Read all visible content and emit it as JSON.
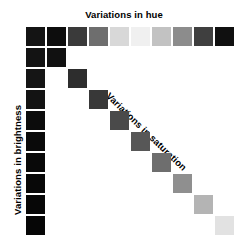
{
  "figure": {
    "background_color": "#ffffff",
    "text_color": "#000000"
  },
  "titles": {
    "hue": "Variations in hue",
    "brightness": "Variations in brightness",
    "saturation": "Variations in saturation"
  },
  "chart_data": {
    "type": "heatmap",
    "title": "Variations in hue",
    "xlabel": "Variations in hue",
    "ylabel": "Variations in brightness",
    "annotations": [
      {
        "text": "Variations in hue",
        "position": "top",
        "rotation": 0
      },
      {
        "text": "Variations in brightness",
        "position": "left",
        "rotation": -90
      },
      {
        "text": "Variations in saturation",
        "position": "diagonal",
        "rotation": 44
      }
    ],
    "grid": {
      "rows": 10,
      "cols": 10,
      "cell_px": 19,
      "pitch_px": 21
    },
    "legend_position": "none",
    "series": [
      {
        "name": "Variations in hue",
        "axis": "top-row",
        "row": 0,
        "cells": [
          {
            "col": 0,
            "color": "#141414"
          },
          {
            "col": 1,
            "color": "#0d0d0d"
          },
          {
            "col": 2,
            "color": "#3a3a3a"
          },
          {
            "col": 3,
            "color": "#6e6e6e"
          },
          {
            "col": 4,
            "color": "#d8d8d8"
          },
          {
            "col": 5,
            "color": "#f0f0f0"
          },
          {
            "col": 6,
            "color": "#c2c2c2"
          },
          {
            "col": 7,
            "color": "#8c8c8c"
          },
          {
            "col": 8,
            "color": "#3f3f3f"
          },
          {
            "col": 9,
            "color": "#101010"
          }
        ]
      },
      {
        "name": "Variations in brightness",
        "axis": "left-column",
        "col": 0,
        "cells": [
          {
            "row": 0,
            "color": "#141414"
          },
          {
            "row": 1,
            "color": "#131313"
          },
          {
            "row": 2,
            "color": "#151515"
          },
          {
            "row": 3,
            "color": "#131313"
          },
          {
            "row": 4,
            "color": "#0c0c0c"
          },
          {
            "row": 5,
            "color": "#0a0a0a"
          },
          {
            "row": 6,
            "color": "#090909"
          },
          {
            "row": 7,
            "color": "#080808"
          },
          {
            "row": 8,
            "color": "#070707"
          },
          {
            "row": 9,
            "color": "#060606"
          }
        ]
      },
      {
        "name": "Variations in saturation",
        "axis": "diagonal",
        "cells": [
          {
            "row": 1,
            "col": 1,
            "color": "#111111"
          },
          {
            "row": 2,
            "col": 2,
            "color": "#2d2d2d"
          },
          {
            "row": 3,
            "col": 3,
            "color": "#383838"
          },
          {
            "row": 4,
            "col": 4,
            "color": "#4a4a4a"
          },
          {
            "row": 5,
            "col": 5,
            "color": "#575757"
          },
          {
            "row": 6,
            "col": 6,
            "color": "#6e6e6e"
          },
          {
            "row": 7,
            "col": 7,
            "color": "#8f8f8f"
          },
          {
            "row": 8,
            "col": 8,
            "color": "#b4b4b4"
          },
          {
            "row": 9,
            "col": 9,
            "color": "#e2e2e2"
          }
        ]
      }
    ]
  }
}
